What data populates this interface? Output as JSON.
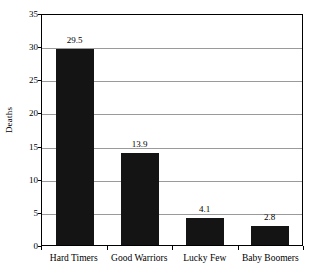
{
  "chart_data": {
    "type": "bar",
    "title": "",
    "subtitle": "",
    "xlabel": "",
    "ylabel": "Deaths",
    "categories": [
      "Hard Timers",
      "Good Warriors",
      "Lucky Few",
      "Baby Boomers"
    ],
    "values": [
      29.5,
      13.9,
      4.1,
      2.8
    ],
    "value_labels": [
      "29.5",
      "13.9",
      "4.1",
      "2.8"
    ],
    "ylim": [
      0,
      35
    ],
    "ytick_values": [
      0,
      5,
      10,
      15,
      20,
      25,
      30,
      35
    ],
    "ytick_labels": [
      "0",
      "5",
      "10",
      "15",
      "20",
      "25",
      "30",
      "35"
    ],
    "grid": "horizontal",
    "legend": "none",
    "bar_color": "#141414",
    "gridline_color": "#9a9a9a",
    "axis_color": "#000000",
    "background_color": "#ffffff"
  }
}
